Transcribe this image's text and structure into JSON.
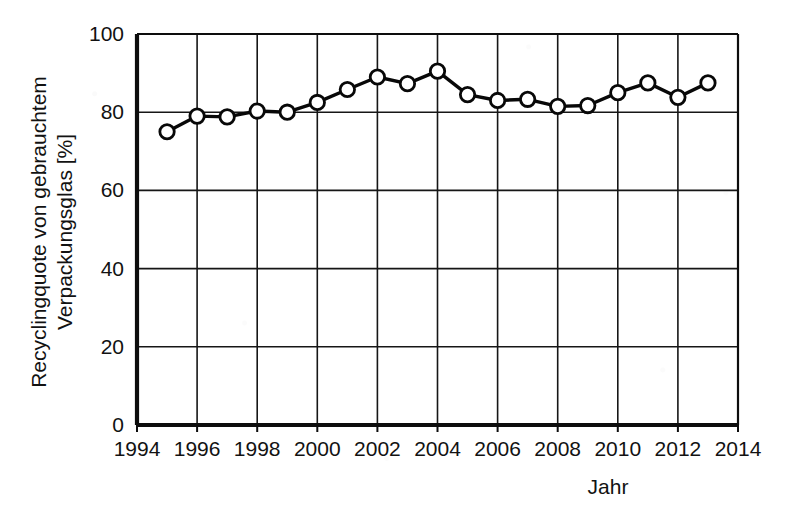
{
  "chart_data": {
    "type": "line",
    "title": "",
    "subtitle": "",
    "xlabel": "Jahr",
    "ylabel": "Recyclingquote von gebrauchtem Verpackungsglas [%]",
    "ylabel_line1": "Recyclingquote von gebrauchtem",
    "ylabel_line2": "Verpackungsglas [%]",
    "xlim": [
      1994,
      2014
    ],
    "ylim": [
      0,
      100
    ],
    "xticks": [
      1994,
      1996,
      1998,
      2000,
      2002,
      2004,
      2006,
      2008,
      2010,
      2012,
      2014
    ],
    "xtick_labels": [
      "1994",
      "1996",
      "1998",
      "2000",
      "2002",
      "2004",
      "2006",
      "2008",
      "2010",
      "2012",
      "2014"
    ],
    "yticks": [
      0,
      20,
      40,
      60,
      80,
      100
    ],
    "ytick_labels": [
      "0",
      "20",
      "40",
      "60",
      "80",
      "100"
    ],
    "grid": true,
    "grid_axes": "both",
    "legend": false,
    "legend_position": "none",
    "marker": "open-circle",
    "line_color": "#080808",
    "marker_face_color": "#ffffff",
    "marker_edge_color": "#080808",
    "background_color": "#ffffff",
    "x": [
      1995,
      1996,
      1997,
      1998,
      1999,
      2000,
      2001,
      2002,
      2003,
      2004,
      2005,
      2006,
      2007,
      2008,
      2009,
      2010,
      2011,
      2012,
      2013
    ],
    "values": [
      75.0,
      79.0,
      78.8,
      80.3,
      80.0,
      82.5,
      85.8,
      89.0,
      87.3,
      90.5,
      84.5,
      83.0,
      83.3,
      81.5,
      81.7,
      85.0,
      87.5,
      83.8,
      87.5
    ],
    "series": [
      {
        "name": "Recyclingquote",
        "x": [
          1995,
          1996,
          1997,
          1998,
          1999,
          2000,
          2001,
          2002,
          2003,
          2004,
          2005,
          2006,
          2007,
          2008,
          2009,
          2010,
          2011,
          2012,
          2013
        ],
        "values": [
          75.0,
          79.0,
          78.8,
          80.3,
          80.0,
          82.5,
          85.8,
          89.0,
          87.3,
          90.5,
          84.5,
          83.0,
          83.3,
          81.5,
          81.7,
          85.0,
          87.5,
          83.8,
          87.5
        ]
      }
    ]
  }
}
